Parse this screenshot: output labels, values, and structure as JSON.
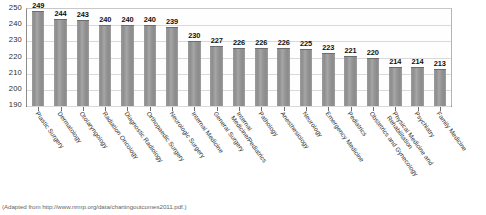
{
  "caption": "(Adapted from http://www.nrmp.org/data/chartingoutcomes2011.pdf.)",
  "chart_data": {
    "type": "bar",
    "title": "",
    "subtitle": "",
    "xlabel": "",
    "ylabel": "",
    "ylim": [
      190,
      250
    ],
    "yticks": [
      250,
      240,
      230,
      220,
      210,
      200,
      190
    ],
    "grid": true,
    "legend": false,
    "legend_position": "none",
    "orientation": "vertical",
    "bar_color": "#8f8f8f",
    "categories": [
      "Plastic Surgery",
      "Dermatology",
      "Otolaryngology",
      "Radiation Oncology",
      "Diagnostic Radiology",
      "Orthopaedic Surgery",
      "Neurologic Surgery",
      "Internal Medicine",
      "General Surgery",
      "Internal Medicine/Pediatrics",
      "Pathology",
      "Anesthesiology",
      "Neurology",
      "Emergency Medicine",
      "Pediatrics",
      "Obstetrics and Gynecology",
      "Physical Medicine and Rehabilitation",
      "Psychiatry",
      "Family Medicine"
    ],
    "values": [
      249,
      244,
      243,
      240,
      240,
      240,
      239,
      230,
      227,
      226,
      226,
      226,
      225,
      223,
      221,
      220,
      214,
      214,
      213
    ]
  }
}
